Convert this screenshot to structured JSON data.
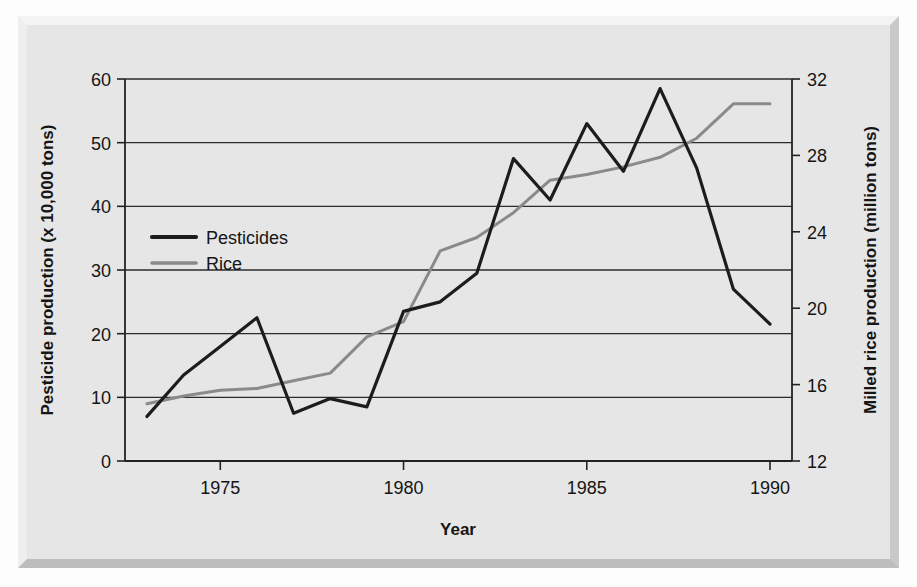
{
  "figure": {
    "background_color": "#e6e6e6",
    "panel_border_color": "#c9c9c9",
    "page_color": "#fdfdfd"
  },
  "chart_data": {
    "type": "line",
    "title": "",
    "subtitle": "",
    "xlabel": "Year",
    "ylabel": "Pesticide production (x 10,000 tons)",
    "y2label": "Milled rice production (million tons)",
    "x": [
      1973,
      1974,
      1975,
      1976,
      1977,
      1978,
      1979,
      1980,
      1981,
      1982,
      1983,
      1984,
      1985,
      1986,
      1987,
      1988,
      1989,
      1990
    ],
    "xlim": [
      1972.4,
      1990.6
    ],
    "xticks": [
      1975,
      1980,
      1985,
      1990
    ],
    "xticklabels": [
      "1975",
      "1980",
      "1985",
      "1990"
    ],
    "ylim": [
      0,
      60
    ],
    "yticks": [
      0,
      10,
      20,
      30,
      40,
      50,
      60
    ],
    "yticklabels": [
      "0",
      "10",
      "20",
      "30",
      "40",
      "50",
      "60"
    ],
    "y2lim": [
      12,
      32
    ],
    "y2ticks": [
      12,
      16,
      20,
      24,
      28,
      32
    ],
    "y2ticklabels": [
      "12",
      "16",
      "20",
      "24",
      "28",
      "32"
    ],
    "grid": true,
    "grid_axis": "y",
    "legend_position": "upper-left-inside",
    "series": [
      {
        "name": "Pesticides",
        "axis": "left",
        "color": "#1c1c1c",
        "linewidth": 3.2,
        "values": [
          7.0,
          13.5,
          18.0,
          22.5,
          7.5,
          9.8,
          8.5,
          23.5,
          25.0,
          29.5,
          47.5,
          41.0,
          53.0,
          45.5,
          58.5,
          46.0,
          27.0,
          21.5
        ]
      },
      {
        "name": "Rice",
        "axis": "right",
        "color": "#8a8a8a",
        "linewidth": 3.0,
        "values_left_scale": [
          7.0,
          8.2,
          9.2,
          9.5,
          10.5,
          11.5,
          17.0,
          19.5,
          30.5,
          32.5,
          36.5,
          41.5,
          42.5,
          43.5,
          45.0,
          48.0,
          55.0,
          55.0
        ],
        "values": [
          15.0,
          15.4,
          15.7,
          15.8,
          16.2,
          16.6,
          18.5,
          19.3,
          23.0,
          23.7,
          25.0,
          26.7,
          27.0,
          27.4,
          27.9,
          28.9,
          30.7,
          30.7
        ]
      }
    ]
  },
  "legend": {
    "items": [
      {
        "label": "Pesticides",
        "color": "#1c1c1c"
      },
      {
        "label": "Rice",
        "color": "#8a8a8a"
      }
    ]
  },
  "axes": {
    "x_title": "Year",
    "y_left_title": "Pesticide production (x 10,000 tons)",
    "y_right_title": "Milled rice production (million tons)",
    "x_tick_labels": [
      "1975",
      "1980",
      "1985",
      "1990"
    ],
    "y_left_tick_labels": [
      "60",
      "50",
      "40",
      "30",
      "20",
      "10",
      "0"
    ],
    "y_right_tick_labels": [
      "32",
      "28",
      "24",
      "20",
      "16",
      "12"
    ]
  }
}
